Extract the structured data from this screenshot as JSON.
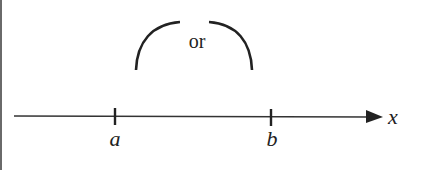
{
  "diagram": {
    "type": "number-line",
    "upper_label": "or",
    "axis_label": "x",
    "points": [
      {
        "label": "a",
        "x": 115
      },
      {
        "label": "b",
        "x": 271
      }
    ],
    "colors": {
      "stroke": "#222222",
      "background": "#ffffff"
    }
  }
}
